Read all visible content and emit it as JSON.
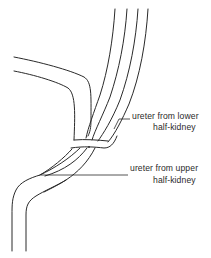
{
  "figure": {
    "title": "",
    "labels": {
      "lower": {
        "line1": "ureter from lower",
        "line2": "half-kidney"
      },
      "upper": {
        "line1": "ureter from upper",
        "line2": "half-kidney"
      }
    },
    "colors": {
      "line": "#2a2a2a",
      "background": "#ffffff"
    }
  }
}
